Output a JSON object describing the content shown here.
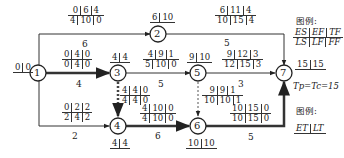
{
  "nodes": [
    {
      "id": "1",
      "et_lt": [
        "0",
        "0"
      ]
    },
    {
      "id": "2",
      "et_lt": [
        "6",
        "10"
      ]
    },
    {
      "id": "3",
      "et_lt": [
        "4",
        "4"
      ]
    },
    {
      "id": "4",
      "et_lt": [
        "4",
        "4"
      ]
    },
    {
      "id": "5",
      "et_lt": [
        "9",
        "10"
      ]
    },
    {
      "id": "6",
      "et_lt": [
        "10",
        "10"
      ]
    },
    {
      "id": "7",
      "et_lt": [
        "15",
        "15"
      ]
    }
  ],
  "activities": [
    {
      "from": "1",
      "to": "2",
      "duration": "6",
      "top": [
        "0",
        "6",
        "4"
      ],
      "bottom": [
        "4",
        "10",
        "0"
      ]
    },
    {
      "from": "1",
      "to": "3",
      "duration": "4",
      "top": [
        "0",
        "4",
        "0"
      ],
      "bottom": [
        "0",
        "4",
        "0"
      ],
      "critical": true
    },
    {
      "from": "1",
      "to": "4",
      "duration": "2",
      "top": [
        "0",
        "2",
        "2"
      ],
      "bottom": [
        "2",
        "4",
        "2"
      ]
    },
    {
      "from": "2",
      "to": "7",
      "duration": "5",
      "top": [
        "6",
        "11",
        "4"
      ],
      "bottom": [
        "10",
        "15",
        "4"
      ]
    },
    {
      "from": "3",
      "to": "5",
      "duration": "5",
      "top": [
        "4",
        "9",
        "1"
      ],
      "bottom": [
        "5",
        "10",
        "0"
      ]
    },
    {
      "from": "3",
      "to": "4",
      "duration": "0",
      "top": [
        "4",
        "4",
        "0"
      ],
      "bottom": [
        "4",
        "4",
        "0"
      ],
      "dummy": true,
      "critical": true
    },
    {
      "from": "5",
      "to": "7",
      "duration": "3",
      "top": [
        "9",
        "12",
        "3"
      ],
      "bottom": [
        "12",
        "15",
        "3"
      ]
    },
    {
      "from": "5",
      "to": "6",
      "duration": "0",
      "top": [
        "9",
        "9",
        "1"
      ],
      "bottom": [
        "10",
        "10",
        "1"
      ],
      "dummy": true
    },
    {
      "from": "4",
      "to": "6",
      "duration": "6",
      "top": [
        "4",
        "10",
        "0"
      ],
      "bottom": [
        "4",
        "10",
        "0"
      ],
      "critical": true
    },
    {
      "from": "6",
      "to": "7",
      "duration": "5",
      "top": [
        "10",
        "15",
        "0"
      ],
      "bottom": [
        "10",
        "15",
        "0"
      ],
      "critical": true
    }
  ],
  "legend": {
    "title1": "图例:",
    "row1": [
      "ES",
      "EF",
      "TF"
    ],
    "row2": [
      "LS",
      "LF",
      "FF"
    ],
    "tp_tc": "Tp=Tc=15",
    "title2": "图例:",
    "et_lt": [
      "ET",
      "LT"
    ]
  },
  "colors": {
    "line": "#333333",
    "critical": "#333333",
    "dummy": "#666666"
  }
}
